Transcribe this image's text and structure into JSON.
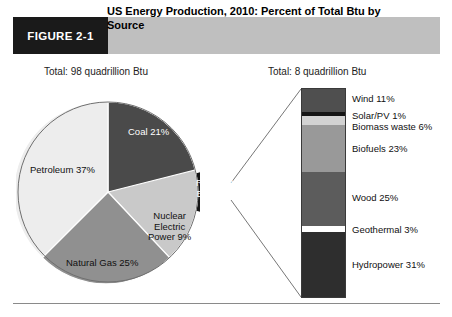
{
  "figure": {
    "tag": "FIGURE 2-1",
    "title": "US Energy Production, 2010: Percent of Total Btu by Source"
  },
  "pie_total_caption": "Total: 98 quadrillion Btu",
  "bar_total_caption": "Total: 8 quadrillion Btu",
  "pie_labels": {
    "petroleum": "Petroleum 37%",
    "coal": "Coal 21%",
    "natural_gas": "Natural Gas 25%",
    "nuclear": "Nuclear\nElectric\nPower 9%",
    "renewable": "Renewable\nEnergy 8%"
  },
  "bar_labels": {
    "wind": "Wind 11%",
    "solar": "Solar/PV 1%",
    "biomass": "Biomass waste 6%",
    "biofuels": "Biofuels 23%",
    "wood": "Wood 25%",
    "geothermal": "Geothermal 3%",
    "hydropower": "Hydropower 31%"
  },
  "colors": {
    "banner": "#bfbfbf",
    "tag_box": "#1a1a1a",
    "petroleum": "#ededed",
    "coal": "#4a4a4a",
    "natural_gas": "#909090",
    "nuclear": "#c9c9c9",
    "renewable": "#151515",
    "wind": "#4f4f4f",
    "solar": "#151515",
    "biomass": "#d2d2d2",
    "biofuels": "#999999",
    "wood": "#5c5c5c",
    "geothermal": "#ffffff",
    "hydropower": "#2e2e2e",
    "rule": "#8a8a8a",
    "connector": "#777777"
  },
  "chart_data": [
    {
      "type": "pie",
      "title": "US Energy Production, 2010: Percent of Total Btu by Source",
      "subtitle": "Total: 98 quadrillion Btu",
      "categories": [
        "Petroleum",
        "Coal",
        "Natural Gas",
        "Nuclear Electric Power",
        "Renewable Energy"
      ],
      "values": [
        37,
        21,
        25,
        9,
        8
      ],
      "unit": "percent of total Btu",
      "exploded_slice": "Renewable Energy",
      "legend": "none",
      "labels_inline": true
    },
    {
      "type": "bar",
      "orientation": "stacked-vertical",
      "title": "Renewable Energy breakdown",
      "subtitle": "Total: 8 quadrillion Btu",
      "categories": [
        "Wind",
        "Solar/PV",
        "Biomass waste",
        "Biofuels",
        "Wood",
        "Geothermal",
        "Hydropower"
      ],
      "values": [
        11,
        1,
        6,
        23,
        25,
        3,
        31
      ],
      "unit": "percent of renewable Btu",
      "ylim": [
        0,
        100
      ],
      "grid": false,
      "legend": "none",
      "labels_inline": true
    }
  ]
}
